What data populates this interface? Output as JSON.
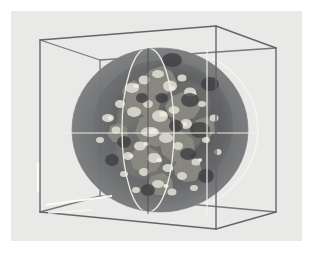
{
  "figure": {
    "title": "",
    "type": "3d-volume-isosurface-rendering",
    "caption": "",
    "canvas": {
      "width": 313,
      "height": 259
    },
    "panel": {
      "x": 11,
      "y": 11,
      "width": 291,
      "height": 230,
      "color": "#e9e9e7"
    },
    "background_color": "#ffffff"
  },
  "colors": {
    "panel_bg": "#e9e9e7",
    "page_bg": "#ffffff",
    "wireframe": "#6f7073",
    "wireframe_dark": "#5a5b5e",
    "highlight_white": "#fdfdfb",
    "sphere_fill": "#6b6c6e",
    "sphere_fill_dark": "#5d5e60",
    "sphere_rim": "#7e7f81",
    "axis_line": "#f2f2ef",
    "great_circle": "#efefe9",
    "isosurface_bright": "#d8d6cd",
    "isosurface_mid": "#a9a79e",
    "isosurface_dark": "#4a4a4c"
  },
  "bounding_box": {
    "label": "axis-aligned bounding cube",
    "stroke_width": 1.4,
    "vertices": {
      "front_top_left": [
        40,
        40
      ],
      "front_top_right": [
        216,
        26
      ],
      "back_top_right": [
        276,
        48
      ],
      "back_top_left": [
        100,
        60
      ],
      "front_bot_left": [
        40,
        212
      ],
      "front_bot_right": [
        216,
        229
      ],
      "back_bot_right": [
        276,
        212
      ],
      "back_bot_left": [
        100,
        196
      ]
    },
    "edges": [
      [
        "front_top_left",
        "front_top_right"
      ],
      [
        "front_top_right",
        "back_top_right"
      ],
      [
        "back_top_right",
        "back_top_left"
      ],
      [
        "back_top_left",
        "front_top_left"
      ],
      [
        "front_bot_left",
        "front_bot_right"
      ],
      [
        "front_bot_right",
        "back_bot_right"
      ],
      [
        "back_bot_right",
        "back_bot_left"
      ],
      [
        "back_bot_left",
        "front_bot_left"
      ],
      [
        "front_top_left",
        "front_bot_left"
      ],
      [
        "front_top_right",
        "front_bot_right"
      ],
      [
        "back_top_right",
        "back_bot_right"
      ],
      [
        "back_top_left",
        "back_bot_left"
      ]
    ],
    "highlight_segments": [
      {
        "name": "left-edge-highlight",
        "from": [
          38,
          162
        ],
        "to": [
          38,
          192
        ]
      },
      {
        "name": "bottom-front-highlight",
        "from": [
          46,
          205
        ],
        "to": [
          112,
          196
        ]
      },
      {
        "name": "bottom-front-highlight-2",
        "from": [
          48,
          213
        ],
        "to": [
          92,
          210
        ]
      }
    ]
  },
  "sphere": {
    "label": "translucent data sphere",
    "center": [
      160,
      130
    ],
    "radius_x": 88,
    "radius_y": 82,
    "fill_opacity": 0.72,
    "limb_arc": {
      "label": "right-limb-highlight",
      "visible": true
    },
    "great_circle": {
      "label": "meridian-great-circle",
      "rx": 26,
      "ry": 82,
      "cx": 148,
      "cy": 130
    }
  },
  "axes": {
    "horizontal_line": {
      "label": "x-axis-crosshair",
      "y": 133,
      "x_start": 62,
      "x_end": 258
    },
    "vertical_line": {
      "label": "y-axis-crosshair",
      "x": 207,
      "y_start": 48,
      "y_end": 216
    },
    "depth_line": {
      "label": "z-axis-crosshair",
      "from": [
        148,
        48
      ],
      "to": [
        148,
        214
      ]
    }
  },
  "isosurface": {
    "label": "scalar-field isosurface cloud",
    "description": "clustered bright blobs concentrated near the sphere center",
    "blob_count": 96,
    "cluster_center": [
      163,
      132
    ],
    "cluster_spread_x": 62,
    "cluster_spread_y": 64
  },
  "legend": {
    "visible": false,
    "entries": []
  },
  "annotations": []
}
